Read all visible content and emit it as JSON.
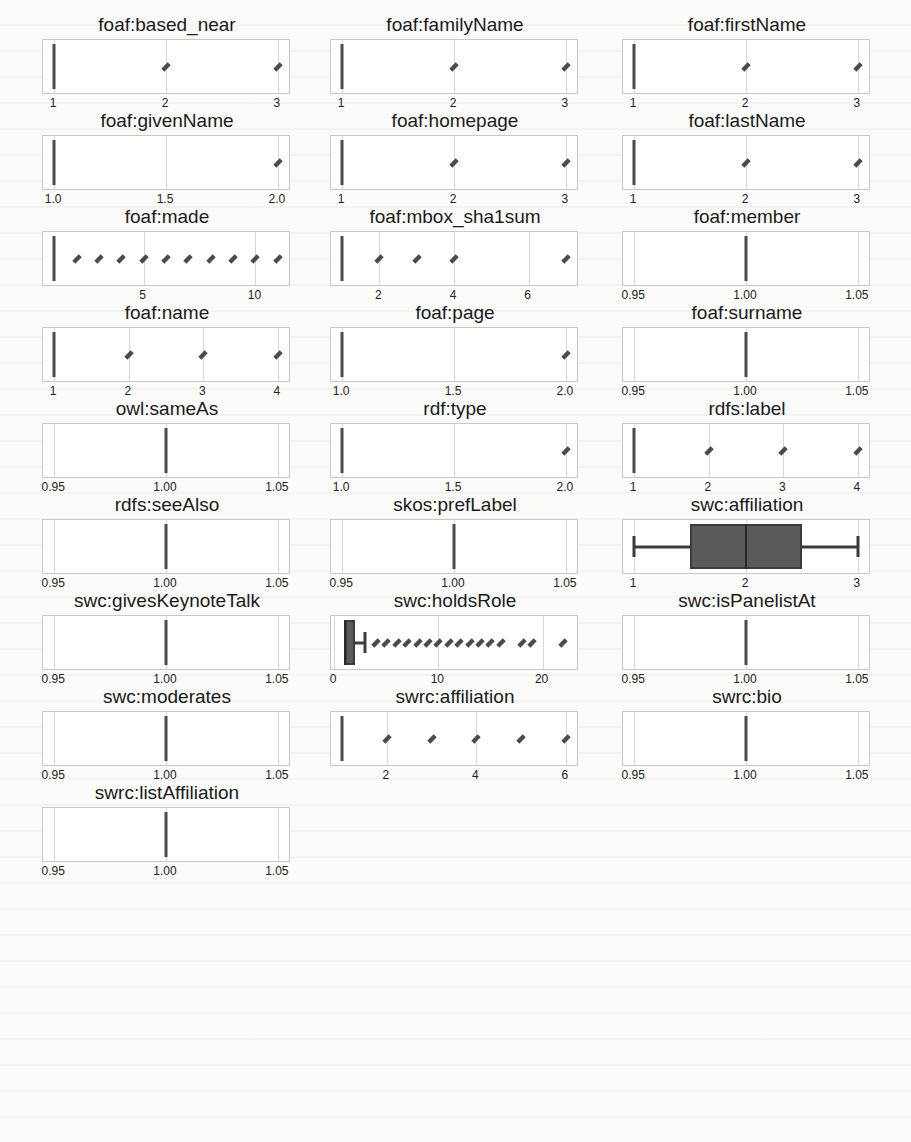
{
  "layout": {
    "columns_x": [
      42,
      330,
      622
    ],
    "row_y0": 14,
    "row_step": 96
  },
  "colors": {
    "box_fill": "#5a5a5a",
    "line": "#3c3c3c",
    "grid": "#d6d6d6",
    "frame": "#c8c8c8"
  },
  "chart_data": [
    {
      "type": "box",
      "title": "foaf:based_near",
      "row": 0,
      "col": 0,
      "xlim": [
        0.9,
        3.1
      ],
      "ticks": [
        1,
        2,
        3
      ],
      "tick_labels": [
        "1",
        "2",
        "3"
      ],
      "median": 1,
      "q1": 1,
      "q3": 1,
      "whisker_low": 1,
      "whisker_high": 1,
      "outliers": [
        2,
        3
      ]
    },
    {
      "type": "box",
      "title": "foaf:familyName",
      "row": 0,
      "col": 1,
      "xlim": [
        0.9,
        3.1
      ],
      "ticks": [
        1,
        2,
        3
      ],
      "tick_labels": [
        "1",
        "2",
        "3"
      ],
      "median": 1,
      "q1": 1,
      "q3": 1,
      "whisker_low": 1,
      "whisker_high": 1,
      "outliers": [
        2,
        3
      ]
    },
    {
      "type": "box",
      "title": "foaf:firstName",
      "row": 0,
      "col": 2,
      "xlim": [
        0.9,
        3.1
      ],
      "ticks": [
        1,
        2,
        3
      ],
      "tick_labels": [
        "1",
        "2",
        "3"
      ],
      "median": 1,
      "q1": 1,
      "q3": 1,
      "whisker_low": 1,
      "whisker_high": 1,
      "outliers": [
        2,
        3
      ]
    },
    {
      "type": "box",
      "title": "foaf:givenName",
      "row": 1,
      "col": 0,
      "xlim": [
        0.95,
        2.05
      ],
      "ticks": [
        1.0,
        1.5,
        2.0
      ],
      "tick_labels": [
        "1.0",
        "1.5",
        "2.0"
      ],
      "median": 1,
      "q1": 1,
      "q3": 1,
      "whisker_low": 1,
      "whisker_high": 1,
      "outliers": [
        2
      ]
    },
    {
      "type": "box",
      "title": "foaf:homepage",
      "row": 1,
      "col": 1,
      "xlim": [
        0.9,
        3.1
      ],
      "ticks": [
        1,
        2,
        3
      ],
      "tick_labels": [
        "1",
        "2",
        "3"
      ],
      "median": 1,
      "q1": 1,
      "q3": 1,
      "whisker_low": 1,
      "whisker_high": 1,
      "outliers": [
        2,
        3
      ]
    },
    {
      "type": "box",
      "title": "foaf:lastName",
      "row": 1,
      "col": 2,
      "xlim": [
        0.9,
        3.1
      ],
      "ticks": [
        1,
        2,
        3
      ],
      "tick_labels": [
        "1",
        "2",
        "3"
      ],
      "median": 1,
      "q1": 1,
      "q3": 1,
      "whisker_low": 1,
      "whisker_high": 1,
      "outliers": [
        2,
        3
      ]
    },
    {
      "type": "box",
      "title": "foaf:made",
      "row": 2,
      "col": 0,
      "xlim": [
        0.5,
        11.5
      ],
      "ticks": [
        5,
        10
      ],
      "tick_labels": [
        "5",
        "10"
      ],
      "median": 1,
      "q1": 1,
      "q3": 1,
      "whisker_low": 1,
      "whisker_high": 1,
      "outliers": [
        2,
        3,
        4,
        5,
        6,
        7,
        8,
        9,
        10,
        11
      ]
    },
    {
      "type": "box",
      "title": "foaf:mbox_sha1sum",
      "row": 2,
      "col": 1,
      "xlim": [
        0.7,
        7.3
      ],
      "ticks": [
        2,
        4,
        6
      ],
      "tick_labels": [
        "2",
        "4",
        "6"
      ],
      "median": 1,
      "q1": 1,
      "q3": 1,
      "whisker_low": 1,
      "whisker_high": 1,
      "outliers": [
        2,
        3,
        4,
        7
      ]
    },
    {
      "type": "box",
      "title": "foaf:member",
      "row": 2,
      "col": 2,
      "xlim": [
        0.945,
        1.055
      ],
      "ticks": [
        0.95,
        1.0,
        1.05
      ],
      "tick_labels": [
        "0.95",
        "1.00",
        "1.05"
      ],
      "median": 1,
      "q1": 1,
      "q3": 1,
      "whisker_low": 1,
      "whisker_high": 1,
      "outliers": []
    },
    {
      "type": "box",
      "title": "foaf:name",
      "row": 3,
      "col": 0,
      "xlim": [
        0.85,
        4.15
      ],
      "ticks": [
        1,
        2,
        3,
        4
      ],
      "tick_labels": [
        "1",
        "2",
        "3",
        "4"
      ],
      "median": 1,
      "q1": 1,
      "q3": 1,
      "whisker_low": 1,
      "whisker_high": 1,
      "outliers": [
        2,
        3,
        4
      ]
    },
    {
      "type": "box",
      "title": "foaf:page",
      "row": 3,
      "col": 1,
      "xlim": [
        0.95,
        2.05
      ],
      "ticks": [
        1.0,
        1.5,
        2.0
      ],
      "tick_labels": [
        "1.0",
        "1.5",
        "2.0"
      ],
      "median": 1,
      "q1": 1,
      "q3": 1,
      "whisker_low": 1,
      "whisker_high": 1,
      "outliers": [
        2
      ]
    },
    {
      "type": "box",
      "title": "foaf:surname",
      "row": 3,
      "col": 2,
      "xlim": [
        0.945,
        1.055
      ],
      "ticks": [
        0.95,
        1.0,
        1.05
      ],
      "tick_labels": [
        "0.95",
        "1.00",
        "1.05"
      ],
      "median": 1,
      "q1": 1,
      "q3": 1,
      "whisker_low": 1,
      "whisker_high": 1,
      "outliers": []
    },
    {
      "type": "box",
      "title": "owl:sameAs",
      "row": 4,
      "col": 0,
      "xlim": [
        0.945,
        1.055
      ],
      "ticks": [
        0.95,
        1.0,
        1.05
      ],
      "tick_labels": [
        "0.95",
        "1.00",
        "1.05"
      ],
      "median": 1,
      "q1": 1,
      "q3": 1,
      "whisker_low": 1,
      "whisker_high": 1,
      "outliers": []
    },
    {
      "type": "box",
      "title": "rdf:type",
      "row": 4,
      "col": 1,
      "xlim": [
        0.95,
        2.05
      ],
      "ticks": [
        1.0,
        1.5,
        2.0
      ],
      "tick_labels": [
        "1.0",
        "1.5",
        "2.0"
      ],
      "median": 1,
      "q1": 1,
      "q3": 1,
      "whisker_low": 1,
      "whisker_high": 1,
      "outliers": [
        2
      ]
    },
    {
      "type": "box",
      "title": "rdfs:label",
      "row": 4,
      "col": 2,
      "xlim": [
        0.85,
        4.15
      ],
      "ticks": [
        1,
        2,
        3,
        4
      ],
      "tick_labels": [
        "1",
        "2",
        "3",
        "4"
      ],
      "median": 1,
      "q1": 1,
      "q3": 1,
      "whisker_low": 1,
      "whisker_high": 1,
      "outliers": [
        2,
        3,
        4
      ]
    },
    {
      "type": "box",
      "title": "rdfs:seeAlso",
      "row": 5,
      "col": 0,
      "xlim": [
        0.945,
        1.055
      ],
      "ticks": [
        0.95,
        1.0,
        1.05
      ],
      "tick_labels": [
        "0.95",
        "1.00",
        "1.05"
      ],
      "median": 1,
      "q1": 1,
      "q3": 1,
      "whisker_low": 1,
      "whisker_high": 1,
      "outliers": []
    },
    {
      "type": "box",
      "title": "skos:prefLabel",
      "row": 5,
      "col": 1,
      "xlim": [
        0.945,
        1.055
      ],
      "ticks": [
        0.95,
        1.0,
        1.05
      ],
      "tick_labels": [
        "0.95",
        "1.00",
        "1.05"
      ],
      "median": 1,
      "q1": 1,
      "q3": 1,
      "whisker_low": 1,
      "whisker_high": 1,
      "outliers": []
    },
    {
      "type": "box",
      "title": "swc:affiliation",
      "row": 5,
      "col": 2,
      "xlim": [
        0.9,
        3.1
      ],
      "ticks": [
        1,
        2,
        3
      ],
      "tick_labels": [
        "1",
        "2",
        "3"
      ],
      "median": 2,
      "q1": 1.5,
      "q3": 2.5,
      "whisker_low": 1,
      "whisker_high": 3,
      "outliers": []
    },
    {
      "type": "box",
      "title": "swc:givesKeynoteTalk",
      "row": 6,
      "col": 0,
      "xlim": [
        0.945,
        1.055
      ],
      "ticks": [
        0.95,
        1.0,
        1.05
      ],
      "tick_labels": [
        "0.95",
        "1.00",
        "1.05"
      ],
      "median": 1,
      "q1": 1,
      "q3": 1,
      "whisker_low": 1,
      "whisker_high": 1,
      "outliers": []
    },
    {
      "type": "box",
      "title": "swc:holdsRole",
      "row": 6,
      "col": 1,
      "xlim": [
        -0.3,
        23.3
      ],
      "ticks": [
        0,
        10,
        20
      ],
      "tick_labels": [
        "0",
        "10",
        "20"
      ],
      "median": 1,
      "q1": 1,
      "q3": 2,
      "whisker_low": 1,
      "whisker_high": 3,
      "outliers": [
        4,
        5,
        6,
        7,
        8,
        9,
        10,
        11,
        12,
        13,
        14,
        15,
        16,
        18,
        19,
        22
      ]
    },
    {
      "type": "box",
      "title": "swc:isPanelistAt",
      "row": 6,
      "col": 2,
      "xlim": [
        0.945,
        1.055
      ],
      "ticks": [
        0.95,
        1.0,
        1.05
      ],
      "tick_labels": [
        "0.95",
        "1.00",
        "1.05"
      ],
      "median": 1,
      "q1": 1,
      "q3": 1,
      "whisker_low": 1,
      "whisker_high": 1,
      "outliers": []
    },
    {
      "type": "box",
      "title": "swc:moderates",
      "row": 7,
      "col": 0,
      "xlim": [
        0.945,
        1.055
      ],
      "ticks": [
        0.95,
        1.0,
        1.05
      ],
      "tick_labels": [
        "0.95",
        "1.00",
        "1.05"
      ],
      "median": 1,
      "q1": 1,
      "q3": 1,
      "whisker_low": 1,
      "whisker_high": 1,
      "outliers": []
    },
    {
      "type": "box",
      "title": "swrc:affiliation",
      "row": 7,
      "col": 1,
      "xlim": [
        0.75,
        6.25
      ],
      "ticks": [
        2,
        4,
        6
      ],
      "tick_labels": [
        "2",
        "4",
        "6"
      ],
      "median": 1,
      "q1": 1,
      "q3": 1,
      "whisker_low": 1,
      "whisker_high": 1,
      "outliers": [
        2,
        3,
        4,
        5,
        6
      ]
    },
    {
      "type": "box",
      "title": "swrc:bio",
      "row": 7,
      "col": 2,
      "xlim": [
        0.945,
        1.055
      ],
      "ticks": [
        0.95,
        1.0,
        1.05
      ],
      "tick_labels": [
        "0.95",
        "1.00",
        "1.05"
      ],
      "median": 1,
      "q1": 1,
      "q3": 1,
      "whisker_low": 1,
      "whisker_high": 1,
      "outliers": []
    },
    {
      "type": "box",
      "title": "swrc:listAffiliation",
      "row": 8,
      "col": 0,
      "xlim": [
        0.945,
        1.055
      ],
      "ticks": [
        0.95,
        1.0,
        1.05
      ],
      "tick_labels": [
        "0.95",
        "1.00",
        "1.05"
      ],
      "median": 1,
      "q1": 1,
      "q3": 1,
      "whisker_low": 1,
      "whisker_high": 1,
      "outliers": []
    }
  ]
}
